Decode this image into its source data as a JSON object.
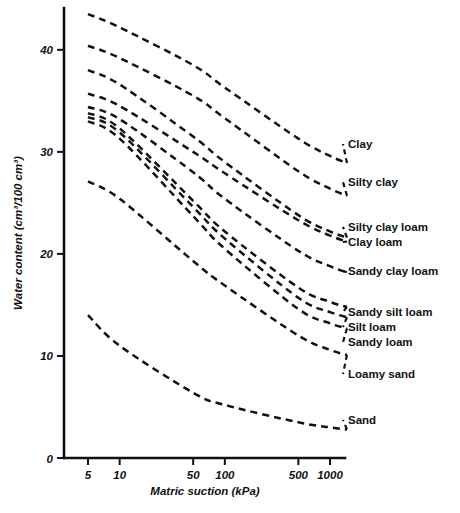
{
  "chart_data": {
    "type": "line",
    "title": "",
    "xlabel": "Matric suction  (kPa)",
    "ylabel": "Water content (cm³/100 cm³)",
    "x_scale": "log",
    "xlim": [
      4,
      1450
    ],
    "ylim": [
      0,
      44
    ],
    "xticks": [
      5,
      10,
      50,
      100,
      500,
      1000
    ],
    "xtick_labels": [
      "5",
      "10",
      "50",
      "100",
      "500",
      "1000"
    ],
    "yticks": [
      0,
      10,
      20,
      30,
      40
    ],
    "ytick_labels": [
      "0",
      "10",
      "20",
      "30",
      "40"
    ],
    "grid": false,
    "legend_position": "right-of-curve-ends",
    "line_style": "dashed",
    "x": [
      5,
      10,
      50,
      100,
      500,
      1000,
      1450
    ],
    "series": [
      {
        "name": "Clay",
        "label": "Clay",
        "values": [
          43.5,
          42.2,
          38.5,
          36.3,
          31.3,
          29.6,
          28.9
        ]
      },
      {
        "name": "Silty clay",
        "label": "Silty clay",
        "values": [
          40.4,
          39.2,
          35.5,
          33.3,
          28.1,
          26.4,
          25.7
        ]
      },
      {
        "name": "Silty clay loam",
        "label": "Silty clay loam",
        "values": [
          38.0,
          36.6,
          31.5,
          29.0,
          23.8,
          22.2,
          21.6
        ]
      },
      {
        "name": "Clay loam",
        "label": "Clay loam",
        "values": [
          35.7,
          34.5,
          30.0,
          27.9,
          23.3,
          21.8,
          21.2
        ]
      },
      {
        "name": "Sandy clay loam",
        "label": "Sandy clay loam",
        "values": [
          34.4,
          33.2,
          28.0,
          25.4,
          20.3,
          18.8,
          18.2
        ]
      },
      {
        "name": "Sandy silt loam",
        "label": "Sandy silt loam",
        "values": [
          33.8,
          32.3,
          25.2,
          22.2,
          16.7,
          15.3,
          14.8
        ]
      },
      {
        "name": "Silt loam",
        "label": "Silt loam",
        "values": [
          33.4,
          31.9,
          24.6,
          21.5,
          15.7,
          14.3,
          13.8
        ]
      },
      {
        "name": "Sandy loam",
        "label": "Sandy loam",
        "values": [
          33.0,
          31.3,
          23.7,
          20.5,
          14.6,
          13.2,
          12.7
        ]
      },
      {
        "name": "Loamy sand",
        "label": "Loamy sand",
        "values": [
          27.1,
          25.4,
          19.3,
          16.9,
          12.0,
          10.6,
          10.1
        ]
      },
      {
        "name": "Sand",
        "label": "Sand",
        "values": [
          14.0,
          11.0,
          6.4,
          5.2,
          3.5,
          3.0,
          2.8
        ]
      }
    ]
  },
  "axes": {
    "y_title": "Water content (cm³/100 cm³)",
    "x_title": "Matric suction  (kPa)"
  },
  "colors": {
    "ink": "#111111",
    "background": "#ffffff"
  }
}
